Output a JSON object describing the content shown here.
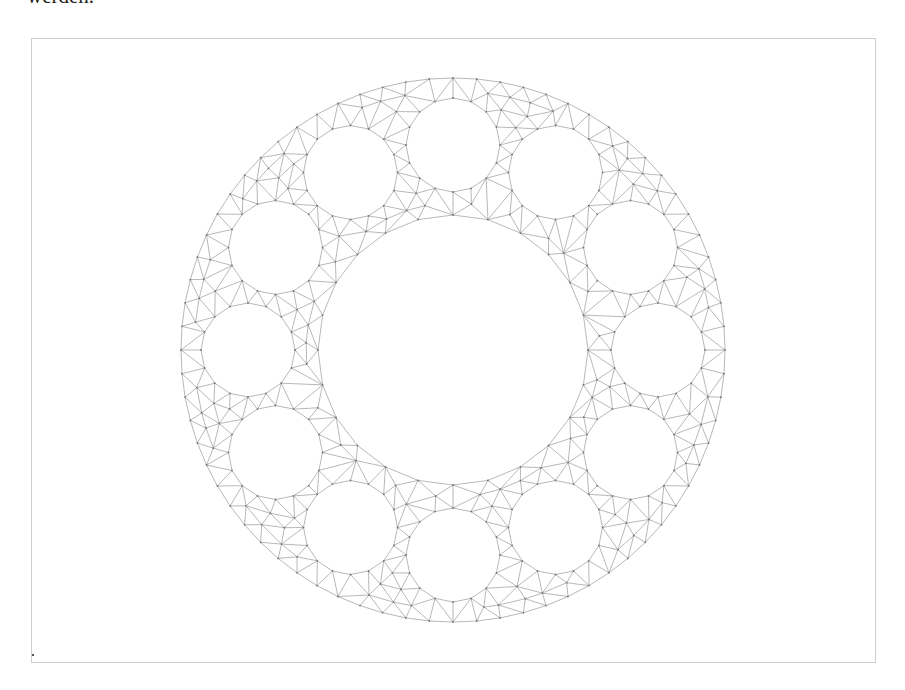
{
  "text": {
    "top_fragment": "werden."
  },
  "figure": {
    "frame": {
      "x": 31,
      "y": 38,
      "width": 845,
      "height": 625
    },
    "mesh": {
      "center": [
        453,
        350
      ],
      "outer_radius": 272,
      "inner_radius": 135,
      "hole_count": 12,
      "hole_ring_radius": 205,
      "hole_radius": 47,
      "hole_start_angle_deg": -90,
      "outer_segments": 72,
      "inner_segments": 24,
      "hole_segments": 16,
      "line_color": "#9a9a9a",
      "node_color": "#777777"
    }
  }
}
